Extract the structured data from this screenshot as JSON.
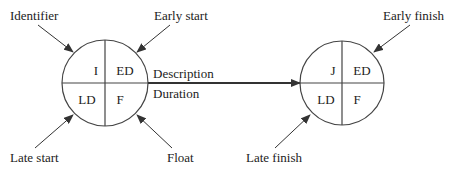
{
  "diagram": {
    "type": "activity-on-node network notation",
    "node_start": {
      "cells": {
        "top_left": "I",
        "top_right": "ED",
        "bottom_left": "LD",
        "bottom_right": "F"
      },
      "callouts": {
        "top_left": "Identifier",
        "top_right": "Early start",
        "bottom_left": "Late start",
        "bottom_right": "Float"
      }
    },
    "arrow": {
      "above": "Description",
      "below": "Duration"
    },
    "node_end": {
      "cells": {
        "top_left": "J",
        "top_right": "ED",
        "bottom_left": "LD",
        "bottom_right": "F"
      },
      "callouts": {
        "top_right": "Early finish",
        "bottom_left": "Late finish"
      }
    },
    "colors": {
      "line": "#333333",
      "text": "#222222",
      "background": "#ffffff"
    }
  }
}
